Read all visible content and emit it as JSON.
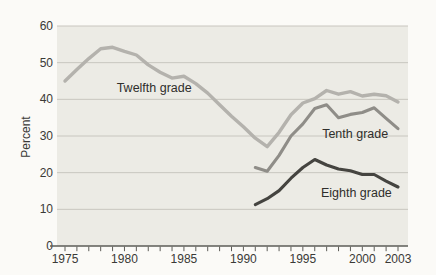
{
  "page": {
    "background": "#fbfaf7"
  },
  "chart": {
    "plot_background": "#ecebe5",
    "grid_color": "#c8c6bf",
    "axis_color": "#5d5c57",
    "tick_color": "#5d5c57",
    "tick_label_color": "#3a3936",
    "annotation_color": "#2f2e2b"
  },
  "chart_data": {
    "type": "line",
    "title": "",
    "xlabel": "",
    "ylabel": "Percent",
    "ylim": [
      0,
      60
    ],
    "y_ticks": [
      0,
      10,
      20,
      30,
      40,
      50,
      60
    ],
    "x_minor_ticks": {
      "start": 1975,
      "end": 2003,
      "step": 1
    },
    "x_tick_labels": [
      "1975",
      "1980",
      "1985",
      "1990",
      "1995",
      "2000",
      "2003"
    ],
    "x_tick_label_years": [
      1975,
      1980,
      1985,
      1990,
      1995,
      2000,
      2003
    ],
    "grid": "horizontal",
    "legend_position": "inline-annotations",
    "series": [
      {
        "name": "Twelfth grade",
        "color": "#b4b2ad",
        "stroke_width": 3.4,
        "x": [
          1975,
          1976,
          1977,
          1978,
          1979,
          1980,
          1981,
          1982,
          1983,
          1984,
          1985,
          1986,
          1987,
          1988,
          1989,
          1990,
          1991,
          1992,
          1993,
          1994,
          1995,
          1996,
          1997,
          1998,
          1999,
          2000,
          2001,
          2002,
          2003
        ],
        "values": [
          45.0,
          48.1,
          51.1,
          53.8,
          54.2,
          53.1,
          52.1,
          49.4,
          47.4,
          45.8,
          46.3,
          44.3,
          41.7,
          38.5,
          35.4,
          32.5,
          29.4,
          27.1,
          31.0,
          35.8,
          39.0,
          40.2,
          42.4,
          41.4,
          42.1,
          40.9,
          41.4,
          41.0,
          39.3
        ]
      },
      {
        "name": "Tenth grade",
        "color": "#8f8d88",
        "stroke_width": 3.1,
        "x": [
          1991,
          1992,
          1993,
          1994,
          1995,
          1996,
          1997,
          1998,
          1999,
          2000,
          2001,
          2002,
          2003
        ],
        "values": [
          21.4,
          20.4,
          24.7,
          30.0,
          33.3,
          37.5,
          38.5,
          35.0,
          35.9,
          36.4,
          37.7,
          34.8,
          32.0
        ]
      },
      {
        "name": "Eighth grade",
        "color": "#454440",
        "stroke_width": 3.1,
        "x": [
          1991,
          1992,
          1993,
          1994,
          1995,
          1996,
          1997,
          1998,
          1999,
          2000,
          2001,
          2002,
          2003
        ],
        "values": [
          11.3,
          12.9,
          15.1,
          18.5,
          21.4,
          23.6,
          22.1,
          21.0,
          20.5,
          19.5,
          19.5,
          17.7,
          16.1
        ]
      }
    ],
    "annotations": [
      {
        "text": "Twelfth grade",
        "x": 1982.5,
        "y": 43.0
      },
      {
        "text": "Tenth grade",
        "x": 1999.4,
        "y": 30.5
      },
      {
        "text": "Eighth grade",
        "x": 1999.5,
        "y": 14.5
      }
    ]
  }
}
